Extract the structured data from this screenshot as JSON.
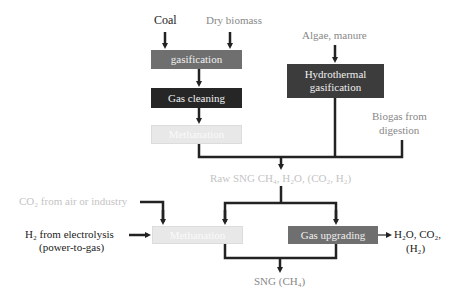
{
  "inputs": {
    "coal": "Coal",
    "dry_biomass": "Dry biomass",
    "algae_manure": "Algae, manure",
    "biogas_line1": "Biogas from",
    "biogas_line2": "digestion",
    "co2_source": "CO₂ from air or industry",
    "h2_line1": "H₂ from electrolysis",
    "h2_line2": "(power-to-gas)"
  },
  "boxes": {
    "gasification": "gasification",
    "gas_cleaning": "Gas cleaning",
    "methanation_top": "Methanation",
    "hydro_line1": "Hydrothermal",
    "hydro_line2": "gasification",
    "methanation_bottom": "Methanation",
    "gas_upgrading": "Gas upgrading"
  },
  "intermediate": {
    "raw_sng": "Raw SNG CH₄, H₂O, (CO₂, H₂)"
  },
  "outputs": {
    "byproducts_line1": "H₂O, CO₂,",
    "byproducts_line2": "(H₂)",
    "sng": "SNG (CH₄)"
  },
  "colors": {
    "line": "#222222",
    "box_mid": "#6f6f6f",
    "box_dark": "#262626",
    "box_light": "#e8e8e8",
    "box_hydro": "#3c3c3c"
  }
}
